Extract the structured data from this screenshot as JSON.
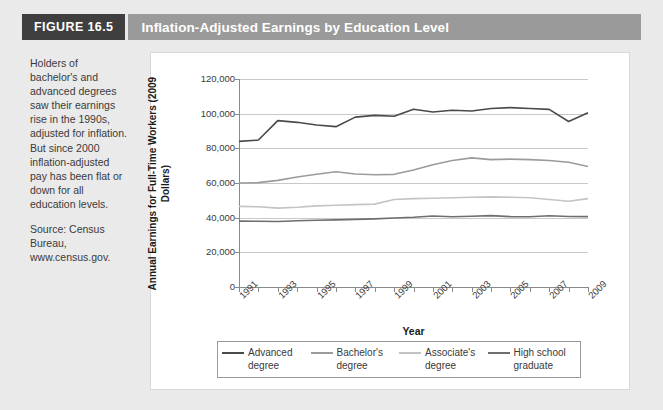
{
  "header": {
    "figure_tag": "FIGURE 16.5",
    "title": "Inflation-Adjusted Earnings by Education Level"
  },
  "caption": {
    "body": "Holders of bachelor's and advanced degrees saw their earnings rise in the 1990s, adjusted for inflation. But since 2000 inflation-adjusted pay has been flat or down for all education levels.",
    "source": "Source: Census Bureau, www.census.gov."
  },
  "colors": {
    "figure_tag_bg": "#3f3f3f",
    "title_bar_bg": "#9a9a9a",
    "page_bg": "#eaeaea",
    "panel_bg": "#ffffff",
    "grid": "#c9c9c9",
    "advanced": "#4a4a4a",
    "bachelors": "#9b9b9b",
    "associates": "#c4c4c4",
    "highschool": "#6e6e6e"
  },
  "chart_data": {
    "type": "line",
    "title": "Inflation-Adjusted Earnings by Education Level",
    "xlabel": "Year",
    "ylabel": "Annual Earnings for Full-Time Workers (2009 Dollars)",
    "xlim": [
      1991,
      2009
    ],
    "ylim": [
      0,
      120000
    ],
    "ytick_values": [
      0,
      20000,
      40000,
      60000,
      80000,
      100000,
      120000
    ],
    "ytick_labels": [
      "0",
      "20,000",
      "40,000",
      "60,000",
      "80,000",
      "100,000",
      "120,000"
    ],
    "x": [
      1991,
      1992,
      1993,
      1994,
      1995,
      1996,
      1997,
      1998,
      1999,
      2000,
      2001,
      2002,
      2003,
      2004,
      2005,
      2006,
      2007,
      2008,
      2009
    ],
    "xtick_labels": [
      "1991",
      "",
      "1993",
      "",
      "1995",
      "",
      "1997",
      "",
      "1999",
      "",
      "2001",
      "",
      "2003",
      "",
      "2005",
      "",
      "2007",
      "",
      "2009"
    ],
    "grid": "horizontal",
    "legend_position": "bottom",
    "series": [
      {
        "name": "Advanced degree",
        "label_line1": "Advanced",
        "label_line2": "degree",
        "color": "#4a4a4a",
        "values": [
          84000,
          84800,
          96000,
          95000,
          93500,
          92500,
          98000,
          99000,
          98500,
          102500,
          101000,
          102000,
          101500,
          103000,
          103500,
          103000,
          102500,
          95500,
          100500
        ]
      },
      {
        "name": "Bachelor's degree",
        "label_line1": "Bachelor's",
        "label_line2": "degree",
        "color": "#9b9b9b",
        "values": [
          60000,
          60200,
          61500,
          63500,
          65000,
          66500,
          65200,
          64800,
          65000,
          67500,
          70500,
          73000,
          74500,
          73500,
          73800,
          73500,
          73000,
          72000,
          69500
        ]
      },
      {
        "name": "Associate's degree",
        "label_line1": "Associate's",
        "label_line2": "degree",
        "color": "#c4c4c4",
        "values": [
          46500,
          46300,
          45500,
          46000,
          46800,
          47200,
          47500,
          47800,
          50500,
          51000,
          51200,
          51500,
          51800,
          52000,
          51800,
          51500,
          50500,
          49500,
          51000
        ]
      },
      {
        "name": "High school graduate",
        "label_line1": "High school",
        "label_line2": "graduate",
        "color": "#6e6e6e",
        "values": [
          38000,
          37900,
          37800,
          38200,
          38500,
          38700,
          39000,
          39300,
          39800,
          40200,
          41000,
          40500,
          40800,
          41200,
          40600,
          40500,
          41100,
          40700,
          40600
        ]
      }
    ]
  }
}
